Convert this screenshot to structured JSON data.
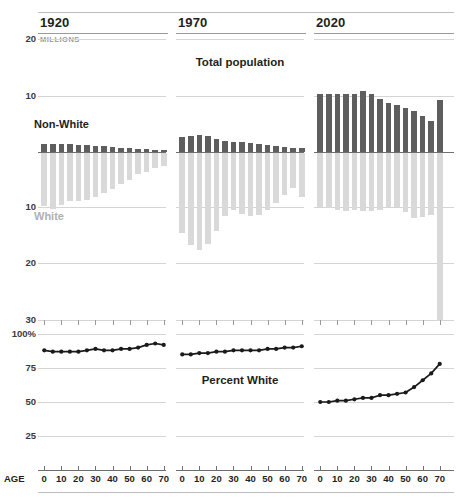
{
  "figure": {
    "top_chart_title": "Total population",
    "bottom_chart_title": "Percent White",
    "units_label": "MILLIONS",
    "age_axis_title": "AGE",
    "series_labels": {
      "nonwhite": "Non-White",
      "white": "White"
    },
    "colors": {
      "nonwhite": "#5e5e5e",
      "white": "#d9d9d9",
      "line": "#1a1a1a",
      "gridline": "#d5d5d5",
      "axis": "#6f6f6f",
      "text": "#231f20",
      "muted": "#9a9a9a"
    }
  },
  "panels": [
    {
      "year": "1920"
    },
    {
      "year": "1970"
    },
    {
      "year": "2020"
    }
  ],
  "axes": {
    "top_y_ticks_up": [
      "20",
      "10"
    ],
    "top_y_ticks_down": [
      "10",
      "20",
      "30"
    ],
    "pct_y_ticks": [
      "100%",
      "75",
      "50",
      "25"
    ],
    "age_ticks": [
      "0",
      "10",
      "20",
      "30",
      "40",
      "50",
      "60",
      "70"
    ]
  },
  "chart_data": [
    {
      "type": "bar",
      "title": "Total population",
      "subtitle": "1920",
      "xlabel": "AGE",
      "ylabel": "MILLIONS",
      "orientation": "vertical-diverging",
      "categories": [
        0,
        5,
        10,
        15,
        20,
        25,
        30,
        35,
        40,
        45,
        50,
        55,
        60,
        65,
        70
      ],
      "series": [
        {
          "name": "Non-White",
          "direction": "up",
          "values": [
            1.4,
            1.4,
            1.4,
            1.4,
            1.3,
            1.2,
            1.1,
            1.0,
            0.9,
            0.75,
            0.65,
            0.5,
            0.45,
            0.35,
            0.3
          ]
        },
        {
          "name": "White",
          "direction": "down",
          "values": [
            9.6,
            10.1,
            9.4,
            8.8,
            8.8,
            8.6,
            8.0,
            7.3,
            6.6,
            5.6,
            4.9,
            3.9,
            3.4,
            2.7,
            2.4
          ]
        }
      ],
      "ylim_up": [
        0,
        20
      ],
      "ylim_down": [
        0,
        30
      ],
      "grid": true
    },
    {
      "type": "bar",
      "title": "Total population",
      "subtitle": "1970",
      "xlabel": "AGE",
      "ylabel": "MILLIONS",
      "orientation": "vertical-diverging",
      "categories": [
        0,
        5,
        10,
        15,
        20,
        25,
        30,
        35,
        40,
        45,
        50,
        55,
        60,
        65,
        70
      ],
      "series": [
        {
          "name": "Non-White",
          "direction": "up",
          "values": [
            2.6,
            2.9,
            3.0,
            2.9,
            2.4,
            1.9,
            1.7,
            1.7,
            1.6,
            1.5,
            1.3,
            1.1,
            0.9,
            0.7,
            0.8
          ]
        },
        {
          "name": "White",
          "direction": "down",
          "values": [
            14.6,
            16.7,
            17.7,
            16.6,
            14.2,
            11.4,
            10.4,
            11.0,
            11.4,
            11.3,
            10.3,
            9.1,
            7.7,
            6.3,
            8.0
          ]
        }
      ],
      "ylim_up": [
        0,
        20
      ],
      "ylim_down": [
        0,
        30
      ],
      "grid": true
    },
    {
      "type": "bar",
      "title": "Total population",
      "subtitle": "2020",
      "xlabel": "AGE",
      "ylabel": "MILLIONS",
      "orientation": "vertical-diverging",
      "categories": [
        0,
        5,
        10,
        15,
        20,
        25,
        30,
        35,
        40,
        45,
        50,
        55,
        60,
        65,
        70
      ],
      "series": [
        {
          "name": "Non-White",
          "direction": "up",
          "values": [
            10.3,
            10.4,
            10.4,
            10.3,
            10.4,
            10.9,
            10.3,
            9.5,
            8.8,
            8.4,
            7.9,
            7.4,
            6.4,
            5.6,
            9.3
          ]
        },
        {
          "name": "White",
          "direction": "down",
          "values": [
            9.9,
            10.0,
            10.4,
            10.5,
            10.4,
            10.6,
            10.6,
            10.3,
            9.8,
            9.9,
            10.7,
            11.9,
            11.7,
            11.3,
            30.5
          ]
        }
      ],
      "ylim_up": [
        0,
        20
      ],
      "ylim_down": [
        0,
        30
      ],
      "grid": true
    },
    {
      "type": "line",
      "title": "Percent White",
      "subtitle": "1920",
      "xlabel": "AGE",
      "ylabel": "Percent",
      "x": [
        0,
        5,
        10,
        15,
        20,
        25,
        30,
        35,
        40,
        45,
        50,
        55,
        60,
        65,
        70
      ],
      "values": [
        88,
        87,
        87,
        87,
        87,
        88,
        89,
        88,
        88,
        89,
        89,
        90,
        92,
        93,
        92
      ],
      "ylim": [
        0,
        100
      ],
      "grid": true
    },
    {
      "type": "line",
      "title": "Percent White",
      "subtitle": "1970",
      "xlabel": "AGE",
      "ylabel": "Percent",
      "x": [
        0,
        5,
        10,
        15,
        20,
        25,
        30,
        35,
        40,
        45,
        50,
        55,
        60,
        65,
        70
      ],
      "values": [
        85,
        85,
        86,
        86,
        87,
        87,
        88,
        88,
        88,
        88,
        89,
        89,
        90,
        90,
        91
      ],
      "ylim": [
        0,
        100
      ],
      "grid": true
    },
    {
      "type": "line",
      "title": "Percent White",
      "subtitle": "2020",
      "xlabel": "AGE",
      "ylabel": "Percent",
      "x": [
        0,
        5,
        10,
        15,
        20,
        25,
        30,
        35,
        40,
        45,
        50,
        55,
        60,
        65,
        70
      ],
      "values": [
        50,
        50,
        51,
        51,
        52,
        53,
        53,
        55,
        55,
        56,
        57,
        61,
        66,
        71,
        78
      ],
      "ylim": [
        0,
        100
      ],
      "grid": true
    }
  ]
}
